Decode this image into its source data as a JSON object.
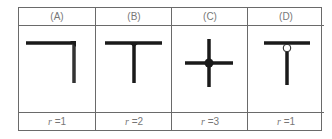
{
  "table": {
    "columns": [
      {
        "header": "(A)",
        "var": "r",
        "eq": " =1",
        "figure": "corner-joint-icon"
      },
      {
        "header": "(B)",
        "var": "r",
        "eq": " =2",
        "figure": "t-joint-filled-icon"
      },
      {
        "header": "(C)",
        "var": "r",
        "eq": " =3",
        "figure": "cross-joint-filled-icon"
      },
      {
        "header": "(D)",
        "var": "r",
        "eq": " =1",
        "figure": "t-joint-open-circle-icon"
      }
    ]
  },
  "colors": {
    "line": "#1a1a1a",
    "border": "#6a6a6a",
    "text": "#777777"
  }
}
